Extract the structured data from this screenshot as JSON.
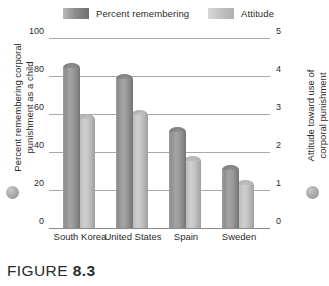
{
  "figure": {
    "caption_word": "FIGURE",
    "caption_number": "8.3"
  },
  "legend": {
    "entries": [
      {
        "label": "Percent remembering",
        "color": "#8e8e8e",
        "swatch": "dark-swatch"
      },
      {
        "label": "Attitude",
        "color": "#c2c2c2",
        "swatch": "light-swatch"
      }
    ]
  },
  "axes": {
    "left": {
      "title_line1": "Percent remembering corporal",
      "title_line2": "punishment as a child",
      "ticks": [
        "0",
        "20",
        "40",
        "60",
        "80",
        "100"
      ]
    },
    "right": {
      "title_line1": "Attitude toward use of",
      "title_line2": "corporal punishment",
      "ticks": [
        "0",
        "1",
        "2",
        "3",
        "4",
        "5"
      ]
    }
  },
  "chart_data": {
    "type": "bar",
    "title": "FIGURE 8.3",
    "xlabel": "",
    "ylabel": "Percent remembering corporal punishment as a child",
    "y2label": "Attitude toward use of corporal punishment",
    "categories": [
      "South Korea",
      "United States",
      "Spain",
      "Sweden"
    ],
    "series": [
      {
        "name": "Percent remembering",
        "axis": "left",
        "color": "#8e8e8e",
        "values": [
          87,
          81,
          53,
          33
        ]
      },
      {
        "name": "Attitude",
        "axis": "right",
        "color": "#c2c2c2",
        "values": [
          3.0,
          3.1,
          1.9,
          1.25
        ]
      }
    ],
    "ylim": [
      0,
      100
    ],
    "y2lim": [
      0,
      5
    ],
    "yticks": [
      0,
      20,
      40,
      60,
      80,
      100
    ],
    "y2ticks": [
      0,
      1,
      2,
      3,
      4,
      5
    ],
    "grid": true,
    "legend_position": "top"
  }
}
